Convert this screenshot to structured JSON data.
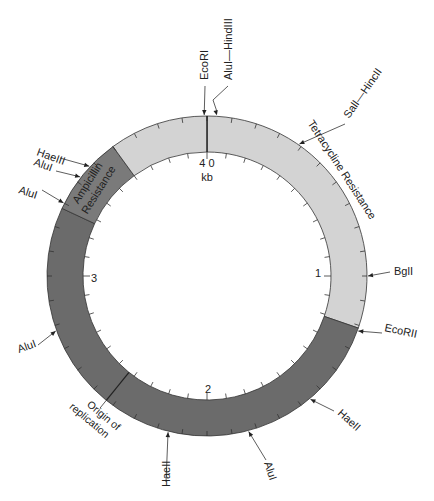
{
  "chart_data": {
    "type": "plasmid-map",
    "title": "",
    "total_kb": 4.0,
    "center_label": [
      "4 0",
      "kb"
    ],
    "kb_labels": [
      {
        "text": "1",
        "kb": 1
      },
      {
        "text": "2",
        "kb": 2
      },
      {
        "text": "3",
        "kb": 3
      }
    ],
    "regions": [
      {
        "name": "Tetracycline Resistance",
        "start_deg": 0,
        "end_deg": 109,
        "color": "#d3d3d3",
        "label": "Tetracycline Resistance"
      },
      {
        "name": "Replication region",
        "start_deg": 109,
        "end_deg": 295,
        "color": "#6b6b6b",
        "label": ""
      },
      {
        "name": "Ampicillin Resistance",
        "start_deg": 295,
        "end_deg": 324,
        "color": "#7a7a7a",
        "label": "Ampicillin Resistance"
      },
      {
        "name": "Upstream region",
        "start_deg": 324,
        "end_deg": 360,
        "color": "#d3d3d3",
        "label": ""
      }
    ],
    "boundaries": [
      {
        "deg": 0,
        "label": ""
      },
      {
        "deg": 219,
        "label": "Origin of replication"
      }
    ],
    "restriction_sites": [
      {
        "name": "EcoRI",
        "deg": -1
      },
      {
        "name": "AluI—HindIII",
        "deg": 3.5
      },
      {
        "name": "SalI—HincII",
        "deg": 35
      },
      {
        "name": "BglI",
        "deg": 90
      },
      {
        "name": "EcoRII",
        "deg": 110
      },
      {
        "name": "HaeII",
        "deg": 140
      },
      {
        "name": "AluI",
        "deg": 165
      },
      {
        "name": "HaeII",
        "deg": 194
      },
      {
        "name": "AluI",
        "deg": 250
      },
      {
        "name": "AluI",
        "deg": 297
      },
      {
        "name": "AluI",
        "deg": 308
      },
      {
        "name": "HaeIII",
        "deg": 313
      }
    ]
  },
  "labels": {
    "center_top": "4 0",
    "center_bottom": "kb",
    "kb1": "1",
    "kb2": "2",
    "kb3": "3",
    "tet": "Tetracycline Resistance",
    "amp_line1": "Ampicillin",
    "amp_line2": "Resistance",
    "ori_line1": "Origin of",
    "ori_line2": "replication",
    "site_ecori": "EcoRI",
    "site_alu_hindiii": "AluI—HindIII",
    "site_sali_hincii": "SalI—HincII",
    "site_bgli": "BglI",
    "site_ecorii": "EcoRII",
    "site_haeii_1": "HaeII",
    "site_alui_1": "AluI",
    "site_haeii_2": "HaeII",
    "site_alui_2": "AluI",
    "site_alui_3": "AluI",
    "site_alui_4": "AluI",
    "site_haeiii": "HaeIII"
  }
}
